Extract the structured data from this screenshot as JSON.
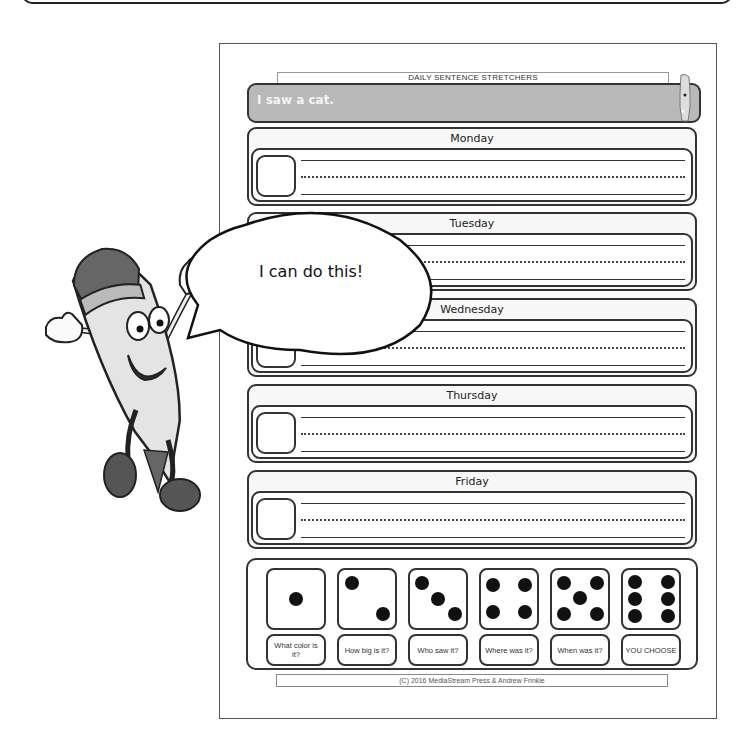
{
  "worksheet": {
    "header_title": "DAILY SENTENCE STRETCHERS",
    "prompt_sentence": "I saw a cat.",
    "days": [
      {
        "label": "Monday"
      },
      {
        "label": "Tuesday"
      },
      {
        "label": "Wednesday"
      },
      {
        "label": "Thursday"
      },
      {
        "label": "Friday"
      }
    ],
    "dice": [
      {
        "pips": 1,
        "label": "What color is it?"
      },
      {
        "pips": 2,
        "label": "How big is it?"
      },
      {
        "pips": 3,
        "label": "Who saw it?"
      },
      {
        "pips": 4,
        "label": "Where was it?"
      },
      {
        "pips": 5,
        "label": "When was it?"
      },
      {
        "pips": 6,
        "label": "YOU CHOOSE"
      }
    ],
    "footer": "(C) 2016 MediaStream Press & Andrew Frinkle"
  },
  "character": {
    "name": "pencil-mascot",
    "speech": "I can do this!"
  },
  "colors": {
    "prompt_bar": "#b9b9b9",
    "outline": "#333333",
    "pip": "#111111"
  }
}
